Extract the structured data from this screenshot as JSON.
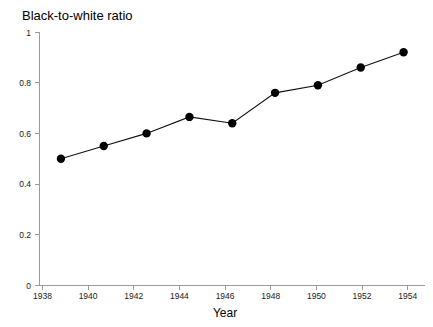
{
  "chart_data": {
    "type": "line",
    "title": "Black-to-white ratio",
    "xlabel": "Year",
    "ylabel": "",
    "x": [
      1938,
      1940,
      1942,
      1944,
      1946,
      1948,
      1950,
      1952,
      1954
    ],
    "values": [
      0.5,
      0.55,
      0.6,
      0.665,
      0.64,
      0.76,
      0.79,
      0.86,
      0.92
    ],
    "xlim": [
      1937,
      1955
    ],
    "ylim": [
      0,
      1
    ],
    "xticks": [
      "1938",
      "1940",
      "1942",
      "1944",
      "1946",
      "1948",
      "1950",
      "1952",
      "1954"
    ],
    "yticks": [
      "0",
      "0.2",
      "0.4",
      "0.6",
      "0.8",
      "1"
    ],
    "grid": false,
    "legend": false,
    "marker": "filled-circle",
    "line_color": "#111111",
    "marker_color": "#000000",
    "axis_color": "#9a9a9a",
    "background_color": "#ffffff"
  },
  "labels": {
    "y_0": "0",
    "y_02": "0.2",
    "y_04": "0.4",
    "y_06": "0.6",
    "y_08": "0.8",
    "y_1": "1",
    "x_1938": "1938",
    "x_1940": "1940",
    "x_1942": "1942",
    "x_1944": "1944",
    "x_1946": "1946",
    "x_1948": "1948",
    "x_1950": "1950",
    "x_1952": "1952",
    "x_1954": "1954"
  }
}
